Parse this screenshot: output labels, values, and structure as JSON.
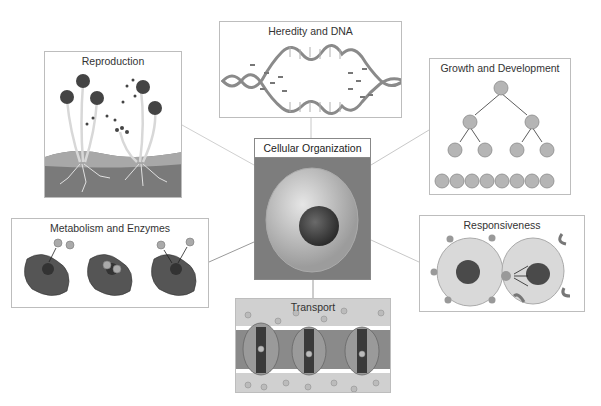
{
  "diagram": {
    "center": {
      "label": "Cellular Organization"
    },
    "panels": [
      {
        "id": "heredity",
        "label": "Heredity and DNA"
      },
      {
        "id": "reproduction",
        "label": "Reproduction"
      },
      {
        "id": "growth",
        "label": "Growth and Development"
      },
      {
        "id": "metabolism",
        "label": "Metabolism and Enzymes"
      },
      {
        "id": "responsiveness",
        "label": "Responsiveness"
      },
      {
        "id": "transport",
        "label": "Transport"
      }
    ]
  },
  "colors": {
    "border": "#bdbdbd",
    "connector": "#c8c8c8",
    "text": "#333333",
    "cell_fill": "#c9c9c9",
    "nucleus": "#3a3a3a"
  }
}
